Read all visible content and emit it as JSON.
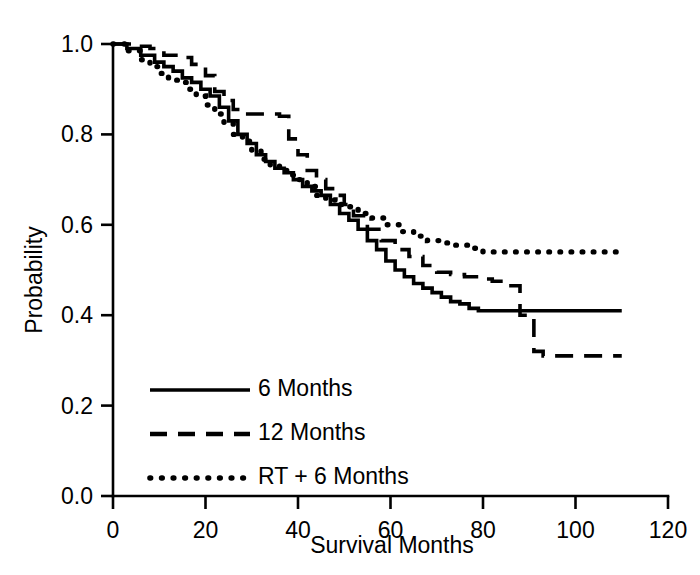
{
  "chart_data": {
    "type": "line",
    "title": "",
    "xlabel": "Survival Months",
    "ylabel": "Probability",
    "xlim": [
      0,
      120
    ],
    "ylim": [
      0.0,
      1.0
    ],
    "xticks": [
      0,
      20,
      40,
      60,
      80,
      100,
      120
    ],
    "xticklabels": [
      "0",
      "20",
      "40",
      "60",
      "80",
      "100",
      "120"
    ],
    "yticks": [
      0.0,
      0.2,
      0.4,
      0.6,
      0.8,
      1.0
    ],
    "yticklabels": [
      "0.0",
      "0.2",
      "0.4",
      "0.6",
      "0.8",
      "1.0"
    ],
    "grid": false,
    "legend_position": "lower-left-inside",
    "plot_kind": "kaplan-meier-survival",
    "series": [
      {
        "name": "6 Months",
        "linestyle": "solid",
        "color": "#000000",
        "final_value": 0.41,
        "x": [
          0,
          3,
          6,
          9,
          11,
          13,
          15,
          17,
          19,
          21,
          23,
          25,
          27,
          29,
          31,
          33,
          35,
          37,
          39,
          41,
          43,
          45,
          47,
          49,
          51,
          53,
          55,
          57,
          59,
          61,
          63,
          65,
          67,
          69,
          71,
          73,
          75,
          77,
          79,
          110
        ],
        "y": [
          1.0,
          0.99,
          0.975,
          0.96,
          0.95,
          0.94,
          0.925,
          0.915,
          0.9,
          0.885,
          0.86,
          0.83,
          0.8,
          0.78,
          0.755,
          0.74,
          0.725,
          0.715,
          0.7,
          0.685,
          0.675,
          0.665,
          0.645,
          0.625,
          0.61,
          0.59,
          0.565,
          0.545,
          0.52,
          0.5,
          0.485,
          0.47,
          0.46,
          0.45,
          0.44,
          0.43,
          0.425,
          0.415,
          0.41,
          0.41
        ]
      },
      {
        "name": "12 Months",
        "linestyle": "dashed",
        "color": "#000000",
        "final_value": 0.31,
        "x": [
          0,
          4,
          8,
          11,
          14,
          17,
          20,
          22,
          24,
          26,
          28,
          30,
          33,
          36,
          38,
          40,
          42,
          44,
          46,
          48,
          50,
          52,
          55,
          58,
          61,
          64,
          67,
          70,
          73,
          76,
          79,
          82,
          85,
          88,
          91,
          93,
          110
        ],
        "y": [
          1.0,
          0.995,
          0.99,
          0.975,
          0.97,
          0.955,
          0.93,
          0.895,
          0.875,
          0.855,
          0.845,
          0.845,
          0.845,
          0.84,
          0.79,
          0.755,
          0.72,
          0.7,
          0.68,
          0.665,
          0.645,
          0.62,
          0.59,
          0.565,
          0.545,
          0.53,
          0.51,
          0.495,
          0.49,
          0.485,
          0.48,
          0.475,
          0.465,
          0.4,
          0.32,
          0.31,
          0.31
        ]
      },
      {
        "name": "RT + 6 Months",
        "linestyle": "dotted",
        "color": "#000000",
        "final_value": 0.54,
        "x": [
          0,
          3,
          6,
          8,
          10,
          12,
          14,
          16,
          18,
          20,
          22,
          24,
          26,
          28,
          30,
          32,
          34,
          36,
          38,
          40,
          42,
          44,
          46,
          48,
          50,
          53,
          56,
          59,
          62,
          65,
          68,
          71,
          74,
          77,
          80,
          110
        ],
        "y": [
          1.0,
          0.985,
          0.965,
          0.95,
          0.935,
          0.92,
          0.915,
          0.9,
          0.885,
          0.865,
          0.845,
          0.825,
          0.8,
          0.785,
          0.765,
          0.745,
          0.73,
          0.72,
          0.71,
          0.7,
          0.685,
          0.665,
          0.655,
          0.645,
          0.64,
          0.625,
          0.615,
          0.6,
          0.585,
          0.575,
          0.565,
          0.56,
          0.555,
          0.548,
          0.54,
          0.54
        ]
      }
    ],
    "legend": [
      {
        "label": "6 Months",
        "linestyle": "solid"
      },
      {
        "label": "12 Months",
        "linestyle": "dashed"
      },
      {
        "label": "RT + 6 Months",
        "linestyle": "dotted"
      }
    ]
  }
}
